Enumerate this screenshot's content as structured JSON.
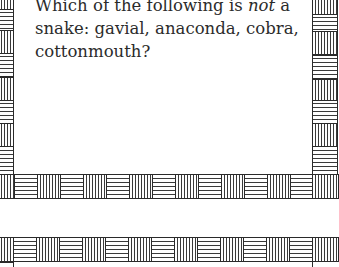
{
  "card": {
    "question_part1": "Which of the following is ",
    "question_emphasis": "not",
    "question_part2": " a snake: gavial, anaconda, cobra, cottonmouth?"
  },
  "border": {
    "line_color": "#2a2a2a",
    "hatch_color": "#3a3a3a",
    "pattern": "alternating vertical/horizontal hatched tiles"
  }
}
